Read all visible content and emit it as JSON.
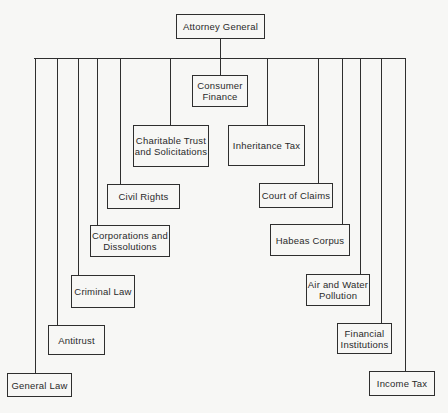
{
  "root": {
    "label": "Attorney General",
    "x": 176,
    "y": 14,
    "w": 89,
    "h": 25
  },
  "bus": {
    "y": 58,
    "x1": 34,
    "x2": 405
  },
  "divisions": [
    {
      "label": "General Law",
      "x": 7,
      "y": 373,
      "w": 65,
      "h": 24,
      "stem_x": 35
    },
    {
      "label": "Antitrust",
      "x": 48,
      "y": 325,
      "w": 57,
      "h": 30,
      "stem_x": 57
    },
    {
      "label": "Criminal Law",
      "x": 71,
      "y": 275,
      "w": 64,
      "h": 33,
      "stem_x": 78
    },
    {
      "label": "Corporations and Dissolutions",
      "x": 90,
      "y": 225,
      "w": 80,
      "h": 32,
      "stem_x": 97
    },
    {
      "label": "Civil Rights",
      "x": 107,
      "y": 184,
      "w": 73,
      "h": 25,
      "stem_x": 120
    },
    {
      "label": "Charitable Trust and Solicitations",
      "x": 133,
      "y": 125,
      "w": 76,
      "h": 42,
      "stem_x": 170
    },
    {
      "label": "Consumer Finance",
      "x": 192,
      "y": 75,
      "w": 56,
      "h": 32,
      "stem_x": 220
    },
    {
      "label": "Inheritance Tax",
      "x": 228,
      "y": 125,
      "w": 77,
      "h": 41,
      "stem_x": 267
    },
    {
      "label": "Court of Claims",
      "x": 259,
      "y": 183,
      "w": 74,
      "h": 25,
      "stem_x": 318
    },
    {
      "label": "Habeas Corpus",
      "x": 270,
      "y": 224,
      "w": 80,
      "h": 32,
      "stem_x": 342
    },
    {
      "label": "Air and Water Pollution",
      "x": 306,
      "y": 274,
      "w": 64,
      "h": 32,
      "stem_x": 360
    },
    {
      "label": "Financial Institutions",
      "x": 337,
      "y": 323,
      "w": 55,
      "h": 31,
      "stem_x": 381
    },
    {
      "label": "Income Tax",
      "x": 369,
      "y": 371,
      "w": 66,
      "h": 25,
      "stem_x": 405
    }
  ]
}
